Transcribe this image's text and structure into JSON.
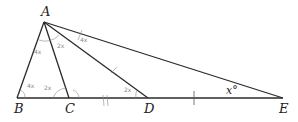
{
  "diagram": {
    "points": {
      "A": {
        "label": "A",
        "x": 44,
        "y": 22
      },
      "B": {
        "label": "B",
        "x": 17,
        "y": 98
      },
      "C": {
        "label": "C",
        "x": 69,
        "y": 98
      },
      "D": {
        "label": "D",
        "x": 148,
        "y": 98
      },
      "E": {
        "label": "E",
        "x": 283,
        "y": 98
      }
    },
    "segments": [
      "AB",
      "AC",
      "AD",
      "AE",
      "BE"
    ],
    "angle_label": "x°",
    "handwritten_notes": [
      "2x",
      "4x",
      "4x",
      "2x",
      "4x",
      "2x"
    ]
  }
}
